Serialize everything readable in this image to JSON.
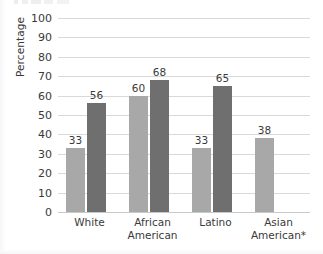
{
  "chart_data": {
    "type": "bar",
    "title": "",
    "xlabel": "",
    "ylabel": "Percentage",
    "ylim": [
      0,
      100
    ],
    "ytick_step": 10,
    "yticks": [
      100,
      90,
      80,
      70,
      60,
      50,
      40,
      30,
      20,
      10,
      0
    ],
    "grid": true,
    "legend": "none",
    "categories": [
      "White",
      "African American",
      "Latino",
      "Asian American*"
    ],
    "category_lines": [
      [
        "White"
      ],
      [
        "African",
        "American"
      ],
      [
        "Latino"
      ],
      [
        "Asian",
        "American*"
      ]
    ],
    "series": [
      {
        "name": "series-light",
        "color": "#a8a8a8",
        "values": [
          33,
          60,
          33,
          38
        ]
      },
      {
        "name": "series-dark",
        "color": "#6f6f6f",
        "values": [
          56,
          68,
          65,
          null
        ]
      }
    ],
    "data_labels": [
      "33",
      "56",
      "60",
      "68",
      "33",
      "65",
      "38"
    ]
  },
  "colors": {
    "light_bar": "#a8a8a8",
    "dark_bar": "#6f6f6f",
    "gridline": "#d9d9d9",
    "text": "#3a3a3a",
    "background": "#ffffff"
  }
}
